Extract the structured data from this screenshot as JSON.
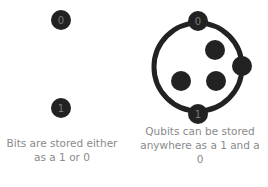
{
  "bits": {
    "nodes": [
      {
        "label": "0"
      },
      {
        "label": "1"
      }
    ],
    "caption": "Bits are stored either as a 1 or 0"
  },
  "qubits": {
    "nodes": [
      {
        "label": "0"
      },
      {
        "label": "1"
      }
    ],
    "caption": "Qubits can be stored anywhere as a 1 and a 0"
  },
  "colors": {
    "node": "#222222",
    "node_text": "#7a7a7a",
    "caption": "#8a8a8a"
  }
}
